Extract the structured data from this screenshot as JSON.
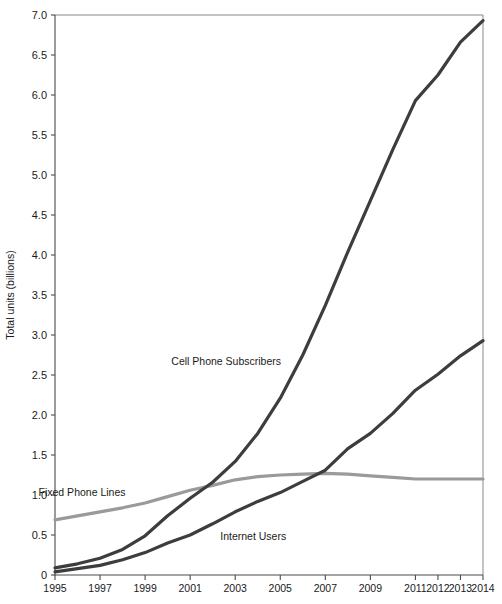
{
  "chart_data": {
    "type": "line",
    "title": "",
    "subtitle": "",
    "xlabel": "",
    "ylabel": "Total units (billions)",
    "grid": false,
    "legend_position": "inline-annotations",
    "x": [
      1995,
      1996,
      1997,
      1998,
      1999,
      2000,
      2001,
      2002,
      2003,
      2004,
      2005,
      2006,
      2007,
      2008,
      2009,
      2010,
      2011,
      2012,
      2013,
      2014
    ],
    "x_tick_labels": [
      "1995",
      "1997",
      "1999",
      "2001",
      "2003",
      "2005",
      "2007",
      "2009",
      "2011",
      "2012",
      "2013",
      "2014"
    ],
    "x_tick_values": [
      1995,
      1997,
      1999,
      2001,
      2003,
      2005,
      2007,
      2009,
      2011,
      2012,
      2013,
      2014
    ],
    "xlim": [
      1995,
      2014
    ],
    "y_tick_labels": [
      "0",
      "0.5",
      "1.0",
      "1.5",
      "2.0",
      "2.5",
      "3.0",
      "3.5",
      "4.0",
      "4.5",
      "5.0",
      "5.5",
      "6.0",
      "6.5",
      "7.0"
    ],
    "y_tick_values": [
      0,
      0.5,
      1.0,
      1.5,
      2.0,
      2.5,
      3.0,
      3.5,
      4.0,
      4.5,
      5.0,
      5.5,
      6.0,
      6.5,
      7.0
    ],
    "ylim": [
      0,
      7.0
    ],
    "series": [
      {
        "name": "Cell Phone Subscribers",
        "color": "#3d3d3d",
        "width": 3.2,
        "label_x": 2002.6,
        "label_y": 2.62,
        "values": [
          0.09,
          0.14,
          0.21,
          0.32,
          0.49,
          0.74,
          0.96,
          1.16,
          1.42,
          1.77,
          2.21,
          2.75,
          3.37,
          4.04,
          4.68,
          5.32,
          5.93,
          6.25,
          6.66,
          6.93
        ]
      },
      {
        "name": "Internet Users",
        "color": "#3d3d3d",
        "width": 3.2,
        "label_x": 2003.8,
        "label_y": 0.44,
        "values": [
          0.04,
          0.08,
          0.12,
          0.19,
          0.28,
          0.4,
          0.5,
          0.64,
          0.79,
          0.92,
          1.03,
          1.17,
          1.31,
          1.58,
          1.77,
          2.02,
          2.31,
          2.51,
          2.74,
          2.93
        ]
      },
      {
        "name": "Fixed Phone Lines",
        "color": "#9a9a9a",
        "width": 3.2,
        "label_x": 1996.2,
        "label_y": 0.99,
        "values": [
          0.69,
          0.74,
          0.79,
          0.84,
          0.9,
          0.98,
          1.06,
          1.12,
          1.19,
          1.23,
          1.25,
          1.26,
          1.27,
          1.26,
          1.24,
          1.22,
          1.2,
          1.2,
          1.2,
          1.2
        ]
      }
    ]
  },
  "colors": {
    "axis": "#4a4a4a",
    "frame": "#8a8a8a",
    "text": "#1a1a1a",
    "dark_series": "#3d3d3d",
    "light_series": "#9a9a9a",
    "background": "#ffffff"
  }
}
